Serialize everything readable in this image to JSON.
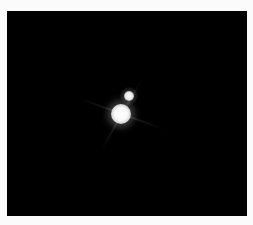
{
  "image": {
    "subject": "binary-point-sources",
    "background_color": "#000000",
    "page_background": "#fbfbfb",
    "sources": [
      {
        "name": "primary",
        "center": [
          121,
          114
        ],
        "core_radius": 10,
        "color": "#ffffff"
      },
      {
        "name": "secondary",
        "center": [
          129,
          96
        ],
        "core_radius": 5,
        "color": "#f0f0f0"
      }
    ]
  }
}
